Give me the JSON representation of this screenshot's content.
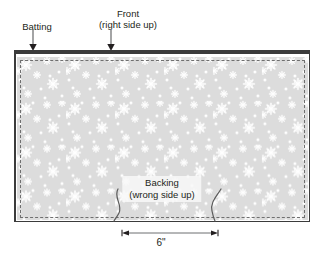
{
  "diagram": {
    "background_color": "#ffffff",
    "fabric_color": "#dcdcdc",
    "outline_color": "#3b3b3b",
    "stitch_color": "#6f6f6f",
    "snowflake_color": "#ffffff"
  },
  "labels": {
    "batting": "Batting",
    "front_line1": "Front",
    "front_line2": "(right side up)",
    "backing_line1": "Backing",
    "backing_line2": "(wrong side up)"
  },
  "dimension": {
    "value": "6\"",
    "start_x": 122,
    "end_x": 218
  },
  "callouts": [
    {
      "name": "batting",
      "label": "Batting",
      "arrow_x": 33,
      "arrow_top": 30,
      "arrow_bottom": 50
    },
    {
      "name": "front",
      "label": "Front",
      "arrow_x": 111,
      "arrow_top": 30,
      "arrow_bottom": 50
    }
  ]
}
